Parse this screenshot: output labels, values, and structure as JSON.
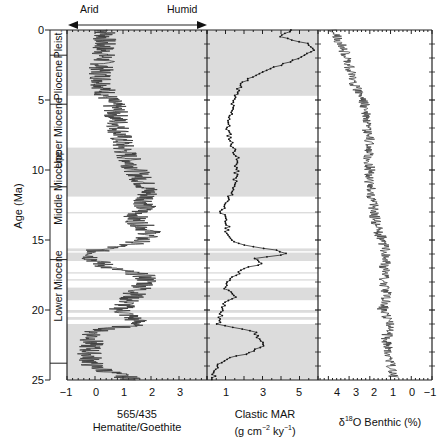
{
  "chart_data": [
    {
      "type": "line",
      "panel": "hematite_goethite",
      "title": "",
      "xlabel": "565/435 Hematite/Goethite",
      "ylabel": "Age (Ma)",
      "xlim": [
        -1,
        4
      ],
      "ylim": [
        25,
        0
      ],
      "x_ticks": [
        -1,
        0,
        1,
        2,
        3
      ],
      "y_ticks": [
        0,
        5,
        10,
        15,
        20,
        25
      ],
      "header_arrow": {
        "left": "Arid",
        "right": "Humid"
      },
      "series": [
        {
          "name": "565/435 ratio",
          "age": [
            0,
            1,
            2,
            3,
            4,
            4.7,
            5.5,
            6.5,
            7.5,
            8.5,
            9.5,
            10.5,
            11.5,
            12.5,
            13.5,
            14.5,
            15.2,
            15.7,
            16.3,
            17,
            17.5,
            18,
            18.7,
            19.3,
            20,
            20.5,
            21,
            21.5,
            22,
            23,
            24,
            24.6,
            25
          ],
          "value": [
            0.4,
            0.3,
            0.3,
            0.2,
            0.3,
            0.4,
            0.7,
            0.8,
            0.9,
            1.0,
            1.3,
            1.6,
            1.9,
            1.8,
            1.4,
            2.0,
            1.5,
            0.1,
            -0.1,
            0.5,
            1.7,
            1.9,
            1.5,
            1.2,
            0.9,
            1.3,
            1.6,
            0.0,
            -0.1,
            -0.2,
            -0.1,
            0.8,
            1.4
          ]
        }
      ]
    },
    {
      "type": "line",
      "panel": "clastic_mar",
      "xlabel": "Clastic MAR (g cm-2 ky-1)",
      "xlim": [
        0,
        6
      ],
      "ylim": [
        25,
        0
      ],
      "x_ticks": [
        1,
        3,
        5
      ],
      "series": [
        {
          "name": "Clastic MAR",
          "age": [
            0,
            0.5,
            1,
            1.5,
            2,
            2.5,
            3,
            3.5,
            4,
            4.5,
            5,
            6,
            7,
            8,
            9,
            10,
            11,
            12,
            13,
            14,
            14.8,
            15.3,
            15.7,
            16,
            16.3,
            16.7,
            17,
            17.5,
            18,
            18.5,
            19,
            19.5,
            20,
            20.5,
            21,
            21.5,
            22,
            22.5,
            23,
            23.5,
            24,
            25
          ],
          "value": [
            4.5,
            4.0,
            5.5,
            5.7,
            5.0,
            4.0,
            3.0,
            2.2,
            1.8,
            1.6,
            1.4,
            1.3,
            1.1,
            1.3,
            1.6,
            1.6,
            1.5,
            1.2,
            0.8,
            1.1,
            1.1,
            1.8,
            3.6,
            4.5,
            2.5,
            3.0,
            2.0,
            1.6,
            1.0,
            1.0,
            1.6,
            1.0,
            0.8,
            0.7,
            0.6,
            2.5,
            2.8,
            3.0,
            2.5,
            1.0,
            0.5,
            0.3
          ]
        }
      ]
    },
    {
      "type": "line",
      "panel": "d18O_benthic",
      "xlabel": "δ18O Benthic (%)",
      "xlim": [
        4.5,
        -1
      ],
      "ylim": [
        25,
        0
      ],
      "x_ticks": [
        4,
        3,
        2,
        1,
        0,
        -1
      ],
      "series": [
        {
          "name": "δ18O benthic",
          "age": [
            0,
            1,
            2,
            3,
            4,
            5,
            6,
            7,
            8,
            9,
            10,
            11,
            12,
            13,
            14,
            15,
            16,
            17,
            18,
            19,
            20,
            21,
            22,
            23,
            24,
            25
          ],
          "value": [
            3.8,
            3.4,
            3.1,
            2.9,
            2.7,
            2.3,
            2.2,
            2.2,
            2.0,
            2.1,
            2.0,
            2.0,
            1.9,
            1.8,
            1.7,
            1.4,
            1.2,
            1.3,
            1.3,
            1.2,
            1.4,
            1.0,
            1.2,
            1.1,
            1.0,
            0.8
          ]
        }
      ]
    }
  ],
  "shaded_intervals_ma": [
    [
      0,
      4.7
    ],
    [
      8.4,
      11.9
    ],
    [
      13.0,
      13.1
    ],
    [
      15.6,
      15.8
    ],
    [
      15.9,
      16.5
    ],
    [
      17.3,
      17.4
    ],
    [
      17.8,
      17.9
    ],
    [
      18.4,
      19.3
    ],
    [
      20.0,
      20.2
    ],
    [
      20.5,
      20.7
    ],
    [
      21.0,
      25.0
    ]
  ],
  "epochs": [
    {
      "label": "Pleist.",
      "top": 0,
      "bottom": 1.8
    },
    {
      "label": "Pliocene",
      "top": 1.8,
      "bottom": 5.3
    },
    {
      "label": "Upper Miocene",
      "top": 5.3,
      "bottom": 11.2
    },
    {
      "label": "Middle Miocene",
      "top": 11.2,
      "bottom": 16.4
    },
    {
      "label": "Lower Miocene",
      "top": 16.4,
      "bottom": 23.8
    }
  ],
  "labels": {
    "y_axis_title": "Age (Ma)",
    "arid": "Arid",
    "humid": "Humid",
    "panel1_title_line1": "565/435",
    "panel1_title_line2": "Hematite/Goethite",
    "panel2_title_line1": "Clastic MAR",
    "panel2_title_line2_a": "(g cm",
    "panel2_title_line2_sup1": "−2",
    "panel2_title_line2_b": " ky",
    "panel2_title_line2_sup2": "−1",
    "panel2_title_line2_c": ")",
    "panel3_title_a": "δ",
    "panel3_title_sup": "18",
    "panel3_title_b": "O Benthic (%)",
    "y_ticks": [
      "0",
      "5",
      "10",
      "15",
      "20",
      "25"
    ],
    "p1_ticks": [
      "−1",
      "0",
      "1",
      "2",
      "3"
    ],
    "p2_ticks": [
      "1",
      "3",
      "5"
    ],
    "p3_ticks": [
      "4",
      "3",
      "2",
      "1",
      "0",
      "−1"
    ]
  },
  "colors": {
    "shade": "#dcdcdc",
    "line": "#111111",
    "fill_dark": "#3a3a3a"
  }
}
